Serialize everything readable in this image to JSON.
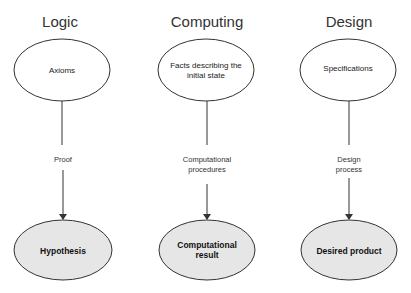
{
  "diagram": {
    "columns": [
      {
        "title": "Logic",
        "start_node": [
          "Axioms"
        ],
        "edge_label": [
          "Proof"
        ],
        "end_node": [
          "Hypothesis"
        ]
      },
      {
        "title": "Computing",
        "start_node": [
          "Facts describing the",
          "initial state"
        ],
        "edge_label": [
          "Computational",
          "procedures"
        ],
        "end_node": [
          "Computational",
          "result"
        ]
      },
      {
        "title": "Design",
        "start_node": [
          "Specifications"
        ],
        "edge_label": [
          "Design",
          "process"
        ],
        "end_node": [
          "Desired product"
        ]
      }
    ],
    "colors": {
      "start_fill": "#ffffff",
      "end_fill": "#e6e6e6",
      "stroke": "#333333"
    }
  }
}
